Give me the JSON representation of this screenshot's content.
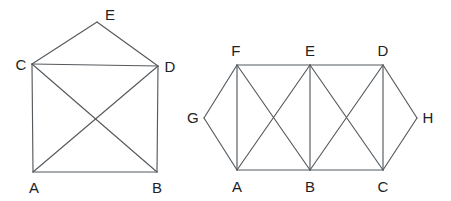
{
  "figure": {
    "background_color": "#ffffff",
    "edge_color": "#555a5e",
    "label_color": "#1e2225",
    "width": 451,
    "height": 201
  },
  "graphs": [
    {
      "id": "left-graph",
      "name": "left-graph",
      "vertex_count": 5,
      "edge_count": 8,
      "vertices": [
        {
          "label": "A",
          "x": 33,
          "y": 172,
          "label_x": 34,
          "label_y": 187
        },
        {
          "label": "B",
          "x": 157,
          "y": 172,
          "label_x": 157,
          "label_y": 187
        },
        {
          "label": "C",
          "x": 32,
          "y": 64,
          "label_x": 21,
          "label_y": 64
        },
        {
          "label": "D",
          "x": 158,
          "y": 66,
          "label_x": 170,
          "label_y": 66
        },
        {
          "label": "E",
          "x": 97,
          "y": 22,
          "label_x": 110,
          "label_y": 14
        }
      ],
      "edges": [
        {
          "from": "A",
          "to": "B"
        },
        {
          "from": "A",
          "to": "C"
        },
        {
          "from": "A",
          "to": "D"
        },
        {
          "from": "B",
          "to": "C"
        },
        {
          "from": "B",
          "to": "D"
        },
        {
          "from": "C",
          "to": "D"
        },
        {
          "from": "C",
          "to": "E"
        },
        {
          "from": "D",
          "to": "E"
        }
      ]
    },
    {
      "id": "right-graph",
      "name": "right-graph",
      "vertex_count": 8,
      "edge_count": 15,
      "vertices": [
        {
          "label": "A",
          "x": 237,
          "y": 170,
          "label_x": 237,
          "label_y": 186
        },
        {
          "label": "B",
          "x": 310,
          "y": 170,
          "label_x": 310,
          "label_y": 186
        },
        {
          "label": "C",
          "x": 383,
          "y": 170,
          "label_x": 383,
          "label_y": 186
        },
        {
          "label": "D",
          "x": 383,
          "y": 65,
          "label_x": 383,
          "label_y": 50
        },
        {
          "label": "E",
          "x": 310,
          "y": 65,
          "label_x": 310,
          "label_y": 50
        },
        {
          "label": "F",
          "x": 237,
          "y": 65,
          "label_x": 236,
          "label_y": 50
        },
        {
          "label": "G",
          "x": 204,
          "y": 118,
          "label_x": 193,
          "label_y": 117
        },
        {
          "label": "H",
          "x": 417,
          "y": 118,
          "label_x": 428,
          "label_y": 117
        }
      ],
      "edges": [
        {
          "from": "A",
          "to": "B"
        },
        {
          "from": "B",
          "to": "C"
        },
        {
          "from": "F",
          "to": "E"
        },
        {
          "from": "E",
          "to": "D"
        },
        {
          "from": "A",
          "to": "F"
        },
        {
          "from": "B",
          "to": "E"
        },
        {
          "from": "C",
          "to": "D"
        },
        {
          "from": "A",
          "to": "E"
        },
        {
          "from": "F",
          "to": "B"
        },
        {
          "from": "B",
          "to": "D"
        },
        {
          "from": "E",
          "to": "C"
        },
        {
          "from": "A",
          "to": "G"
        },
        {
          "from": "G",
          "to": "F"
        },
        {
          "from": "C",
          "to": "H"
        },
        {
          "from": "H",
          "to": "D"
        }
      ]
    }
  ]
}
